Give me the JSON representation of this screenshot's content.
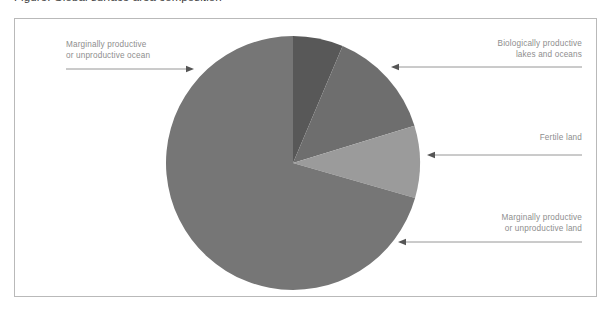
{
  "figure": {
    "clipped_caption": "Figure: Global surface area composition",
    "frame_border_color": "#b9b9b9",
    "background_color": "#ffffff",
    "label_text_color": "#8e8e8e",
    "arrow_color": "#8a8a8a"
  },
  "chart_data": {
    "type": "pie",
    "title": "",
    "subtitle": "",
    "xlabel": "",
    "ylabel": "",
    "legend_position": "callout-labels",
    "grid": false,
    "units": "share of global surface area",
    "start_angle_deg": 0,
    "direction": "clockwise",
    "center": {
      "x": 293,
      "y": 163
    },
    "radius": 127,
    "categories": [
      "Biologically productive lakes and oceans",
      "Fertile land",
      "Marginally productive or unproductive land",
      "Marginally productive or unproductive ocean"
    ],
    "values": [
      6.4,
      13.9,
      9.2,
      70.5
    ],
    "slices": [
      {
        "label_line1": "Biologically productive",
        "label_line2": "lakes and oceans",
        "value": 6.4,
        "color": "#585858",
        "start_deg": 0,
        "end_deg": 23,
        "label_side": "right"
      },
      {
        "label_line1": "Fertile land",
        "label_line2": "",
        "value": 13.9,
        "color": "#6e6e6e",
        "start_deg": 23,
        "end_deg": 73,
        "label_side": "right"
      },
      {
        "label_line1": "Marginally productive",
        "label_line2": "or unproductive land",
        "value": 9.2,
        "color": "#9b9b9b",
        "start_deg": 73,
        "end_deg": 106,
        "label_side": "right"
      },
      {
        "label_line1": "Marginally productive",
        "label_line2": "or unproductive ocean",
        "value": 70.5,
        "color": "#767676",
        "start_deg": 106,
        "end_deg": 360,
        "label_side": "left"
      }
    ]
  },
  "callouts": {
    "ocean": {
      "line1": "Marginally productive",
      "line2": "or unproductive ocean"
    },
    "bio": {
      "line1": "Biologically productive",
      "line2": "lakes and oceans"
    },
    "fertile": {
      "line1": "Fertile land",
      "line2": ""
    },
    "land": {
      "line1": "Marginally productive",
      "line2": "or unproductive land"
    }
  }
}
